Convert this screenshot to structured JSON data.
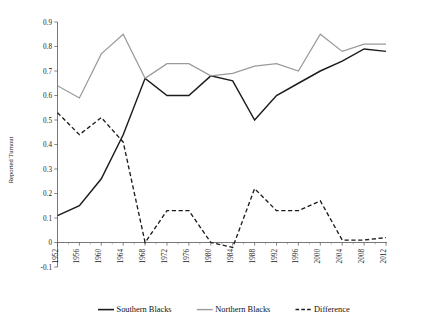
{
  "chart_data": {
    "type": "line",
    "title": "",
    "xlabel": "",
    "ylabel": "Reported Turnout",
    "x": [
      1952,
      1956,
      1960,
      1964,
      1968,
      1972,
      1976,
      1980,
      1984,
      1988,
      1992,
      1996,
      2000,
      2004,
      2008,
      2012
    ],
    "xtick_labels": [
      "1952",
      "1956",
      "1960",
      "1964",
      "1968",
      "1972",
      "1976",
      "1980",
      "1984",
      "1988",
      "1992",
      "1996",
      "2000",
      "2004",
      "2008",
      "2012"
    ],
    "ytick_labels": [
      "-0.1",
      "0",
      "0.1",
      "0.2",
      "0.3",
      "0.4",
      "0.5",
      "0.6",
      "0.7",
      "0.8",
      "0.9"
    ],
    "ytick_values": [
      -0.1,
      0,
      0.1,
      0.2,
      0.3,
      0.4,
      0.5,
      0.6,
      0.7,
      0.8,
      0.9
    ],
    "ylim": [
      -0.1,
      0.9
    ],
    "xlim": [
      1952,
      2012
    ],
    "grid": false,
    "legend_position": "bottom",
    "series": [
      {
        "name": "Southern Blacks",
        "style": "solid",
        "color": "#1c1c1c",
        "values": [
          0.11,
          0.15,
          0.26,
          0.44,
          0.67,
          0.6,
          0.6,
          0.68,
          0.66,
          0.5,
          0.6,
          0.65,
          0.7,
          0.74,
          0.79,
          0.78
        ]
      },
      {
        "name": "Northern Blacks",
        "style": "solid",
        "color": "#9a9a9a",
        "values": [
          0.64,
          0.59,
          0.77,
          0.85,
          0.67,
          0.73,
          0.73,
          0.68,
          0.69,
          0.72,
          0.73,
          0.7,
          0.85,
          0.78,
          0.81,
          0.81
        ]
      },
      {
        "name": "Difference",
        "style": "dashed",
        "color": "#1c1c1c",
        "values": [
          0.53,
          0.44,
          0.51,
          0.41,
          0.0,
          0.13,
          0.13,
          0.0,
          -0.02,
          0.22,
          0.13,
          0.13,
          0.17,
          0.01,
          0.01,
          0.02
        ]
      }
    ]
  },
  "legend": {
    "items": [
      {
        "label": "Southern Blacks"
      },
      {
        "label": "Northern Blacks"
      },
      {
        "label": "Difference"
      }
    ]
  },
  "axes": {
    "y_title": "Reported Turnout"
  }
}
